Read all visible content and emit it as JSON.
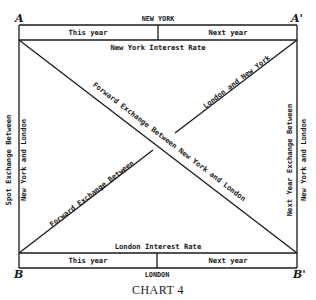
{
  "diagram": {
    "corners": {
      "top_left": "A",
      "top_right": "A'",
      "bottom_left": "B",
      "bottom_right": "B'"
    },
    "top": {
      "city": "NEW YORK",
      "this_year": "This year",
      "next_year": "Next year",
      "interest_rate": "New York Interest Rate"
    },
    "bottom": {
      "city": "LONDON",
      "this_year": "This year",
      "next_year": "Next year",
      "interest_rate": "London Interest Rate"
    },
    "left_side": {
      "line1": "Spot Exchange Between",
      "line2": "New York and London"
    },
    "right_side": {
      "line1": "Next Year Exchange Between",
      "line2": "New York and London"
    },
    "diagonal_main": "Forward Exchange Between New York and London",
    "diagonal_secondary_lower": "Forward Exchange Between",
    "diagonal_secondary_upper": "London and New York",
    "caption": "CHART 4"
  },
  "colors": {
    "ink": "#1a1a1a",
    "paper": "#ffffff"
  }
}
